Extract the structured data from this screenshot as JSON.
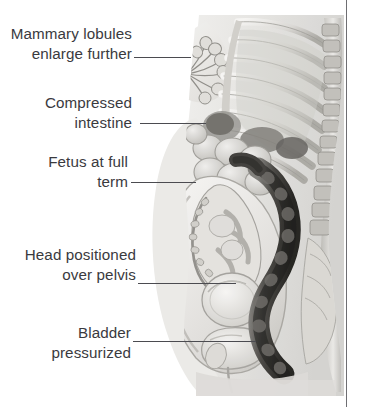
{
  "figure": {
    "type": "medical-anatomical-illustration",
    "view": "sagittal / mid-line cutaway, left-facing",
    "style": "grayscale airbrush render",
    "background_color": "#ffffff",
    "text_color": "#3a3a3e",
    "leader_color": "#4b4b50",
    "margin_rule_color": "#6e6e72"
  },
  "labels": [
    {
      "id": "mammary",
      "text": "Mammary lobules\nenlarge further",
      "align": "right",
      "leader_to": "breast-lobules"
    },
    {
      "id": "intestine",
      "text": "Compressed\nintestine",
      "align": "right",
      "leader_to": "small-intestine"
    },
    {
      "id": "fetus",
      "text": "Fetus at full\nterm",
      "align": "right",
      "leader_to": "fetus"
    },
    {
      "id": "head",
      "text": "Head positioned\nover pelvis",
      "align": "right",
      "leader_to": "fetal-head"
    },
    {
      "id": "bladder",
      "text": "Bladder\npressurized",
      "align": "right",
      "leader_to": "bladder"
    }
  ],
  "anatomy": [
    {
      "id": "torso-outline",
      "name": "maternal torso silhouette"
    },
    {
      "id": "breast",
      "name": "breast"
    },
    {
      "id": "breast-lobules",
      "name": "mammary lobules"
    },
    {
      "id": "nipple",
      "name": "nipple"
    },
    {
      "id": "rib-cage",
      "name": "rib cage"
    },
    {
      "id": "spine",
      "name": "vertebral column"
    },
    {
      "id": "sacrum",
      "name": "sacrum"
    },
    {
      "id": "diaphragm",
      "name": "diaphragm"
    },
    {
      "id": "stomach",
      "name": "stomach"
    },
    {
      "id": "small-intestine",
      "name": "compressed small intestine"
    },
    {
      "id": "colon",
      "name": "colon and rectum"
    },
    {
      "id": "uterus",
      "name": "gravid uterus"
    },
    {
      "id": "fetus",
      "name": "fetus at full term"
    },
    {
      "id": "fetal-head",
      "name": "fetal head over pelvis"
    },
    {
      "id": "bladder",
      "name": "urinary bladder"
    },
    {
      "id": "pubic-bone",
      "name": "pubic symphysis"
    }
  ]
}
